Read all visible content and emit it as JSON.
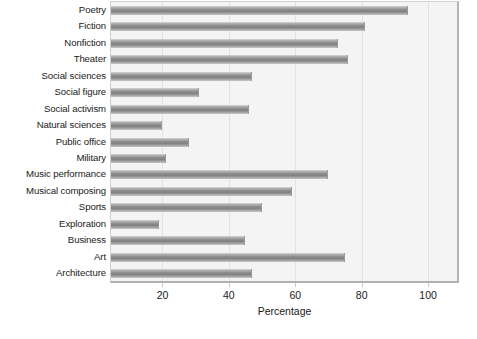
{
  "chart_data": {
    "type": "bar",
    "orientation": "horizontal",
    "title": "",
    "xlabel": "Percentage",
    "ylabel": "",
    "xlim": [
      4.5,
      109
    ],
    "xticks": [
      20,
      40,
      60,
      80,
      100
    ],
    "grid": true,
    "legend": null,
    "categories": [
      "Poetry",
      "Fiction",
      "Nonfiction",
      "Theater",
      "Social sciences",
      "Social figure",
      "Social activism",
      "Natural sciences",
      "Public office",
      "Military",
      "Music performance",
      "Musical composing",
      "Sports",
      "Exploration",
      "Business",
      "Art",
      "Architecture"
    ],
    "values": [
      94,
      81,
      73,
      76,
      47,
      31,
      46,
      20,
      28,
      21,
      70,
      59,
      50,
      19,
      45,
      75,
      47
    ],
    "bar_color": "#8e8e8e",
    "plot_background": "#f4f4f4",
    "gridline_color": "#e2e2e2"
  }
}
